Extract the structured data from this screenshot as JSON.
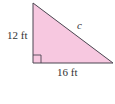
{
  "diagram": {
    "shape": "right-triangle",
    "fill_color": "#F7C8E0",
    "stroke_color": "#4A4550",
    "labels": {
      "vertical_leg": "12 ft",
      "horizontal_leg": "16 ft",
      "hypotenuse": "c"
    },
    "right_angle_marker": true
  }
}
